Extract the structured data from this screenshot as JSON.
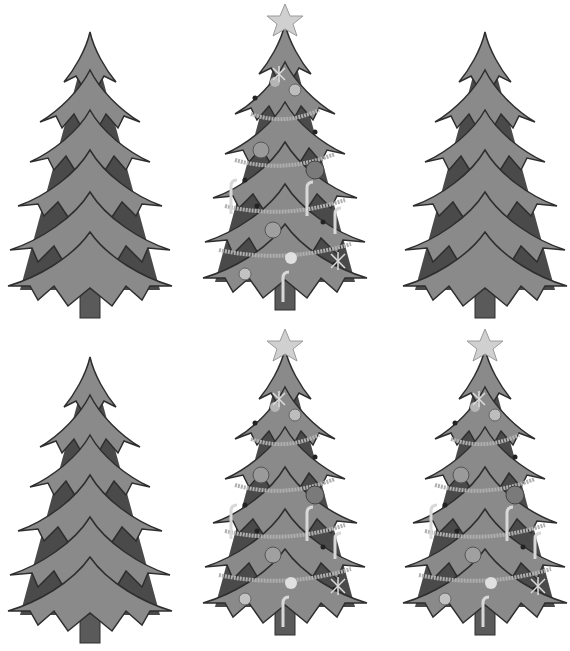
{
  "image": {
    "description": "Grayscale illustration of six Christmas trees in a 3x2 grid",
    "background": "#ffffff"
  },
  "trees": [
    {
      "id": "tree-1",
      "decorated": false,
      "star": false,
      "x": 0,
      "y": 10
    },
    {
      "id": "tree-2",
      "decorated": true,
      "star": true,
      "x": 195,
      "y": 8
    },
    {
      "id": "tree-3",
      "decorated": false,
      "star": false,
      "x": 395,
      "y": 10
    },
    {
      "id": "tree-4",
      "decorated": false,
      "star": false,
      "x": 0,
      "y": 335
    },
    {
      "id": "tree-5",
      "decorated": true,
      "star": true,
      "x": 195,
      "y": 333
    },
    {
      "id": "tree-6",
      "decorated": true,
      "star": true,
      "x": 395,
      "y": 333
    }
  ],
  "colors": {
    "foliage_dark": "#4a4a4a",
    "foliage_light": "#8a8a8a",
    "outline": "#2e2e2e",
    "trunk": "#5a5a5a",
    "star": "#cfcfcf",
    "ornament": "#9a9a9a",
    "garland": "#a8a8a8"
  }
}
